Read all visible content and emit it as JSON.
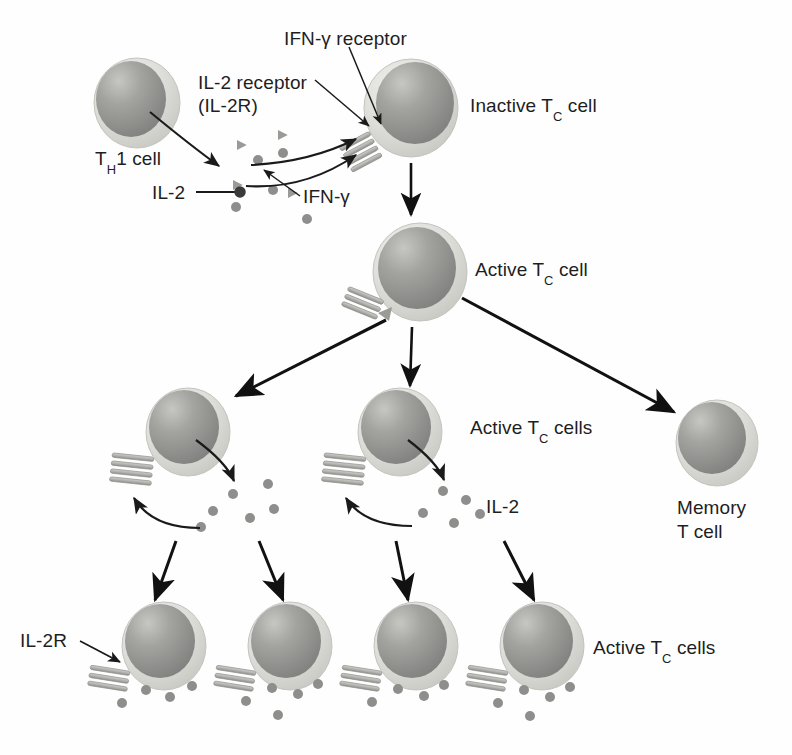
{
  "figure": {
    "background": "#fefefe",
    "ink": "#1e1e1e"
  },
  "palette": {
    "membrane_light": "#d8d8d4",
    "membrane_edge": "#b9b9b4",
    "nucleus_dark": "#8a8a88",
    "nucleus_mid": "#9b9b98",
    "nucleus_hi": "#c2c2bf",
    "receptor": "#b6b6b2",
    "receptor_edge": "#8f8f8b",
    "cytokine_dot": "#8e8e8c",
    "cytokine_triangle": "#9a9a97",
    "arrow": "#111111",
    "leader": "#1a1a1a"
  },
  "labels": {
    "ifn_gamma_receptor": "IFN-γ receptor",
    "il2_receptor": "IL-2 receptor",
    "il2_receptor_abbrev": "(IL-2R)",
    "inactive_tc_cell": "Inactive T",
    "inactive_tc_cell_sub": "C",
    "inactive_tc_cell_tail": " cell",
    "th1_cell": "T",
    "th1_cell_sub": "H",
    "th1_cell_tail": "1 cell",
    "il2": "IL-2",
    "ifn_gamma": "IFN-γ",
    "active_tc_cell": "Active T",
    "active_tc_cell_sub": "C",
    "active_tc_cell_tail": " cell",
    "active_tc_cells_mid": "Active T",
    "active_tc_cells_mid_sub": "C",
    "active_tc_cells_mid_tail": " cells",
    "il2_mid": "IL-2",
    "memory_t_cell_line1": "Memory",
    "memory_t_cell_line2": "T cell",
    "il2r": "IL-2R",
    "active_tc_cells_bottom": "Active T",
    "active_tc_cells_bottom_sub": "C",
    "active_tc_cells_bottom_tail": " cells"
  },
  "cells": [
    {
      "name": "th1-cell",
      "cx": 137,
      "cy": 103,
      "r": 42,
      "receptors": false
    },
    {
      "name": "inactive-tc-cell",
      "cx": 411,
      "cy": 108,
      "r": 46,
      "receptors": true
    },
    {
      "name": "active-tc-cell",
      "cx": 420,
      "cy": 272,
      "r": 46,
      "receptors": true
    },
    {
      "name": "active-tc-cell-left",
      "cx": 188,
      "cy": 432,
      "r": 41,
      "receptors": true
    },
    {
      "name": "active-tc-cell-right",
      "cx": 400,
      "cy": 432,
      "r": 41,
      "receptors": true
    },
    {
      "name": "memory-t-cell",
      "cx": 717,
      "cy": 443,
      "r": 40,
      "receptors": false
    },
    {
      "name": "active-tc-cell-bottom-1",
      "cx": 164,
      "cy": 646,
      "r": 41,
      "receptors": true
    },
    {
      "name": "active-tc-cell-bottom-2",
      "cx": 290,
      "cy": 646,
      "r": 41,
      "receptors": true
    },
    {
      "name": "active-tc-cell-bottom-3",
      "cx": 416,
      "cy": 646,
      "r": 41,
      "receptors": true
    },
    {
      "name": "active-tc-cell-bottom-4",
      "cx": 542,
      "cy": 646,
      "r": 41,
      "receptors": true
    }
  ],
  "cytokines": {
    "il2_dots_top": [
      [
        258,
        160
      ],
      [
        283,
        153
      ],
      [
        273,
        190
      ],
      [
        236,
        207
      ],
      [
        307,
        219
      ]
    ],
    "ifn_triangles_top": [
      [
        241,
        145
      ],
      [
        282,
        135
      ],
      [
        237,
        185
      ],
      [
        292,
        193
      ]
    ],
    "il2_dots_mid_left": [
      [
        233,
        494
      ],
      [
        268,
        484
      ],
      [
        213,
        511
      ],
      [
        250,
        518
      ],
      [
        274,
        509
      ],
      [
        201,
        527
      ]
    ],
    "il2_dots_mid_right": [
      [
        443,
        491
      ],
      [
        466,
        500
      ],
      [
        423,
        513
      ],
      [
        454,
        523
      ],
      [
        480,
        514
      ]
    ],
    "il2_dots_bottom_1": [
      [
        146,
        690
      ],
      [
        170,
        697
      ],
      [
        122,
        703
      ],
      [
        192,
        686
      ]
    ],
    "il2_dots_bottom_2": [
      [
        272,
        688
      ],
      [
        298,
        694
      ],
      [
        246,
        701
      ],
      [
        318,
        684
      ],
      [
        278,
        715
      ]
    ],
    "il2_dots_bottom_3": [
      [
        398,
        689
      ],
      [
        424,
        696
      ],
      [
        372,
        702
      ],
      [
        444,
        685
      ]
    ],
    "il2_dots_bottom_4": [
      [
        524,
        690
      ],
      [
        550,
        697
      ],
      [
        498,
        703
      ],
      [
        570,
        687
      ],
      [
        530,
        716
      ]
    ]
  },
  "label_positions": {
    "ifn_gamma_receptor": {
      "x": 284,
      "y": 28
    },
    "il2_receptor": {
      "x": 198,
      "y": 72
    },
    "il2_receptor_abbrev": {
      "x": 198,
      "y": 95
    },
    "inactive_tc_cell": {
      "x": 470,
      "y": 95
    },
    "th1_cell": {
      "x": 95,
      "y": 148
    },
    "il2": {
      "x": 152,
      "y": 198
    },
    "ifn_gamma": {
      "x": 303,
      "y": 196
    },
    "active_tc_cell": {
      "x": 475,
      "y": 259
    },
    "active_tc_cells_mid": {
      "x": 470,
      "y": 417
    },
    "il2_mid": {
      "x": 486,
      "y": 494
    },
    "memory_t_cell": {
      "x": 677,
      "y": 502
    },
    "il2r": {
      "x": 20,
      "y": 641
    },
    "active_tc_cells_bottom": {
      "x": 593,
      "y": 637
    }
  }
}
